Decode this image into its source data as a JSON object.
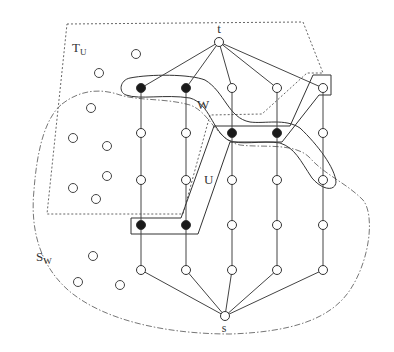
{
  "diagram": {
    "labels": {
      "t": {
        "text": "t",
        "x": 219,
        "y": 33
      },
      "s": {
        "text": "s",
        "x": 224,
        "y": 332
      },
      "W": {
        "text": "W",
        "x": 197,
        "y": 109
      },
      "U": {
        "text": "U",
        "x": 204,
        "y": 184
      },
      "TU": {
        "text": "T",
        "sub": "U",
        "x": 72,
        "y": 52
      },
      "SW": {
        "text": "S",
        "sub": "W",
        "x": 36,
        "y": 261
      }
    },
    "colors": {
      "stroke": "#444444",
      "filled_node": "#1a1a1a",
      "empty_node": "#ffffff"
    },
    "terminals": {
      "t": {
        "x": 219,
        "y": 42
      },
      "s": {
        "x": 225,
        "y": 316
      }
    },
    "columns_x": [
      141,
      186,
      232,
      277,
      323
    ],
    "rows_y": [
      88,
      133,
      180,
      225,
      270
    ],
    "grid_nodes": [
      {
        "col": 0,
        "row": 0,
        "filled": true
      },
      {
        "col": 1,
        "row": 0,
        "filled": true
      },
      {
        "col": 2,
        "row": 0,
        "filled": false
      },
      {
        "col": 3,
        "row": 0,
        "filled": false
      },
      {
        "col": 4,
        "row": 0,
        "filled": false
      },
      {
        "col": 0,
        "row": 1,
        "filled": false
      },
      {
        "col": 1,
        "row": 1,
        "filled": false
      },
      {
        "col": 2,
        "row": 1,
        "filled": true
      },
      {
        "col": 3,
        "row": 1,
        "filled": true
      },
      {
        "col": 4,
        "row": 1,
        "filled": false
      },
      {
        "col": 0,
        "row": 2,
        "filled": false
      },
      {
        "col": 1,
        "row": 2,
        "filled": false
      },
      {
        "col": 2,
        "row": 2,
        "filled": false
      },
      {
        "col": 3,
        "row": 2,
        "filled": false
      },
      {
        "col": 4,
        "row": 2,
        "filled": false
      },
      {
        "col": 0,
        "row": 3,
        "filled": true
      },
      {
        "col": 1,
        "row": 3,
        "filled": true
      },
      {
        "col": 2,
        "row": 3,
        "filled": false
      },
      {
        "col": 3,
        "row": 3,
        "filled": false
      },
      {
        "col": 4,
        "row": 3,
        "filled": false
      },
      {
        "col": 0,
        "row": 4,
        "filled": false
      },
      {
        "col": 1,
        "row": 4,
        "filled": false
      },
      {
        "col": 2,
        "row": 4,
        "filled": false
      },
      {
        "col": 3,
        "row": 4,
        "filled": false
      },
      {
        "col": 4,
        "row": 4,
        "filled": false
      }
    ],
    "isolated_nodes": [
      {
        "x": 136,
        "y": 54
      },
      {
        "x": 99,
        "y": 73
      },
      {
        "x": 91,
        "y": 108
      },
      {
        "x": 73,
        "y": 138
      },
      {
        "x": 107,
        "y": 146
      },
      {
        "x": 107,
        "y": 176
      },
      {
        "x": 73,
        "y": 188
      },
      {
        "x": 96,
        "y": 199
      },
      {
        "x": 93,
        "y": 256
      },
      {
        "x": 78,
        "y": 282
      },
      {
        "x": 120,
        "y": 285
      }
    ],
    "regions": {
      "T_U": {
        "style": "dotted",
        "points": "67,24 303,22 323,73 307,73 262,114 210,115 183,214 47,214"
      },
      "U": {
        "style": "solid",
        "points": "313,75 331,75 331,95 319,95 282,142 230,142 198,234 131,234 131,218 181,218 214,126 290,126"
      },
      "W": {
        "style": "solid",
        "path": "M 130,78 C 150,74 190,74 205,80 C 225,92 228,118 250,122 C 265,124 285,118 300,128 C 318,145 335,168 336,182 C 335,192 322,190 312,178 C 300,160 295,148 280,143 C 262,140 240,146 228,140 C 212,130 210,104 190,98 C 165,94 140,100 126,95 C 118,92 120,80 130,78 Z"
      },
      "S_W": {
        "style": "dash-dot",
        "path": "M 62,104 C 80,90 100,88 120,95 C 140,101 165,98 190,105 C 210,112 216,140 240,145 C 262,148 295,142 310,158 C 325,175 345,182 363,200 C 375,215 370,260 350,290 C 330,320 290,332 230,334 C 170,334 105,322 68,290 C 40,265 30,230 34,190 C 37,150 45,118 62,104 Z"
      }
    }
  }
}
